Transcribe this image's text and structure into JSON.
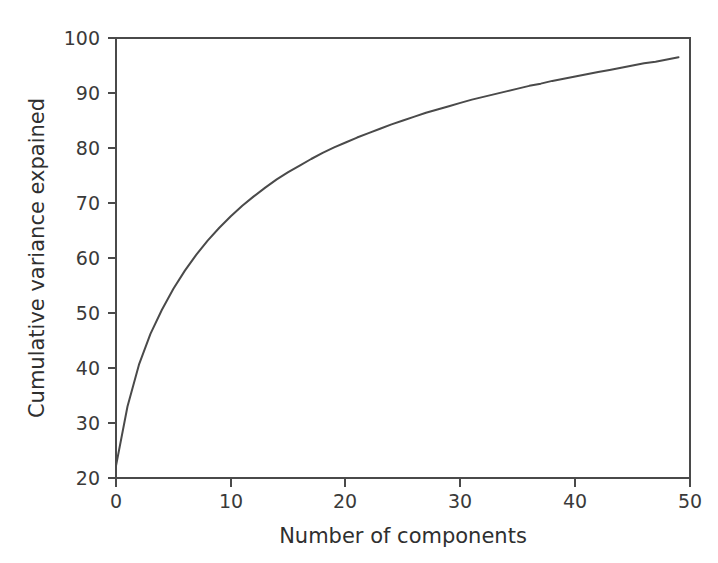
{
  "chart_data": {
    "type": "line",
    "title": "",
    "xlabel": "Number of components",
    "ylabel": "Cumulative variance expained",
    "xlim": [
      0,
      50
    ],
    "ylim": [
      20,
      100
    ],
    "xticks": [
      0,
      10,
      20,
      30,
      40,
      50
    ],
    "yticks": [
      20,
      30,
      40,
      50,
      60,
      70,
      80,
      90,
      100
    ],
    "xtick_labels": [
      "0",
      "10",
      "20",
      "30",
      "40",
      "50"
    ],
    "ytick_labels": [
      "20",
      "30",
      "40",
      "50",
      "60",
      "70",
      "80",
      "90",
      "100"
    ],
    "grid": false,
    "legend": null,
    "legend_position": "none",
    "series": [
      {
        "name": "Cumulative explained variance",
        "color": "#4a4a4a",
        "line_width": 2,
        "x": [
          0,
          1,
          2,
          3,
          4,
          5,
          6,
          7,
          8,
          9,
          10,
          11,
          12,
          13,
          14,
          15,
          16,
          17,
          18,
          19,
          20,
          21,
          22,
          23,
          24,
          25,
          26,
          27,
          28,
          29,
          30,
          31,
          32,
          33,
          34,
          35,
          36,
          37,
          38,
          39,
          40,
          41,
          42,
          43,
          44,
          45,
          46,
          47,
          48,
          49
        ],
        "values": [
          22.2,
          33.0,
          40.6,
          46.2,
          50.6,
          54.4,
          57.7,
          60.6,
          63.2,
          65.5,
          67.6,
          69.5,
          71.2,
          72.8,
          74.3,
          75.6,
          76.8,
          78.0,
          79.1,
          80.1,
          81.0,
          81.9,
          82.7,
          83.5,
          84.3,
          85.0,
          85.7,
          86.4,
          87.0,
          87.6,
          88.2,
          88.8,
          89.3,
          89.8,
          90.3,
          90.8,
          91.3,
          91.7,
          92.2,
          92.6,
          93.0,
          93.4,
          93.8,
          94.2,
          94.6,
          95.0,
          95.4,
          95.7,
          96.1,
          96.5
        ]
      }
    ]
  },
  "figure": {
    "background_color": "#ffffff",
    "axis_color": "#4a4a4a",
    "text_color": "#3a3a3a"
  }
}
